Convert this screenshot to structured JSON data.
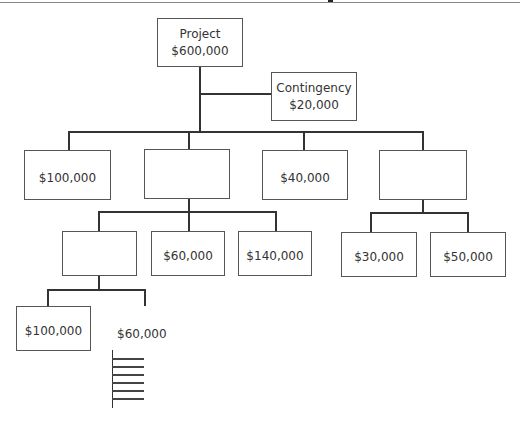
{
  "diagram": {
    "type": "budget-breakdown-tree",
    "root": {
      "label": "Project",
      "value": "$600,000"
    },
    "contingency": {
      "label": "Contingency",
      "value": "$20,000"
    },
    "level2": [
      {
        "value": "$100,000"
      },
      {
        "value": ""
      },
      {
        "value": "$40,000"
      },
      {
        "value": ""
      }
    ],
    "level3_under_box2": [
      {
        "value": ""
      },
      {
        "value": "$60,000"
      },
      {
        "value": "$140,000"
      }
    ],
    "level3_under_box4": [
      {
        "value": "$30,000"
      },
      {
        "value": "$50,000"
      }
    ],
    "level4_under_level3_box1": [
      {
        "value": "$100,000"
      },
      {
        "value": "$60,000",
        "boxed": false
      }
    ],
    "continuation_ticks": 6
  },
  "colors": {
    "line": "#333333",
    "box_border": "#555555",
    "text": "#333333",
    "background": "#ffffff"
  }
}
